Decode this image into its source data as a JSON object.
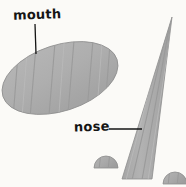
{
  "figure": {
    "background_color": "#fbfaf7",
    "stroke_color": "#151515",
    "shape_fill": "#adadad",
    "shape_fill_light": "#bdbdbd",
    "shape_fill_dark": "#9a9a9a",
    "shape_edge": "#8a8a8a",
    "width": 186,
    "height": 187
  },
  "labels": {
    "mouth": "mouth",
    "nose": "nose"
  },
  "parts": [
    {
      "id": "mouth",
      "name": "mouth",
      "shape": "tilted-striped-ellipse",
      "center_x": 60,
      "center_y": 78,
      "radius_x": 60,
      "radius_y": 33,
      "rotation_deg": -18,
      "stripe_count": 6
    },
    {
      "id": "nose",
      "name": "nose",
      "shape": "tall-striped-triangle",
      "apex_x": 172,
      "apex_y": 17,
      "base_left_x": 122,
      "base_right_x": 152,
      "base_y": 179,
      "stripe_count": 3
    },
    {
      "id": "dome-left",
      "name": "left-dome",
      "shape": "semicircle",
      "center_x": 106,
      "base_y": 168,
      "radius": 12
    },
    {
      "id": "dome-right",
      "name": "right-dome",
      "shape": "semicircle",
      "center_x": 175,
      "base_y": 184,
      "radius": 12
    }
  ],
  "leaders": [
    {
      "id": "leader-mouth",
      "from_label": "mouth",
      "x1": 35,
      "y1": 24,
      "x2": 36,
      "y2": 54
    },
    {
      "id": "leader-nose",
      "from_label": "nose",
      "x1": 109,
      "y1": 129,
      "x2": 142,
      "y2": 129
    }
  ]
}
